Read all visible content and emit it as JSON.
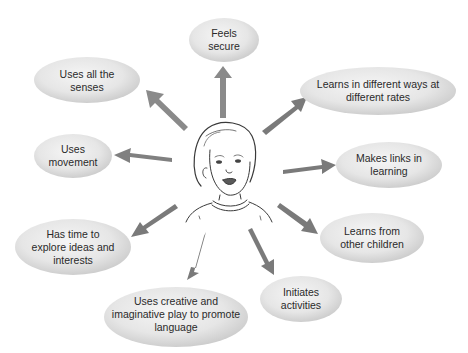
{
  "diagram": {
    "title": "",
    "center": {
      "label": "child-illustration"
    },
    "colors": {
      "bubble_light": "#f2f2f2",
      "bubble_dark": "#c9c9c9",
      "arrow_light": "#c4c4c4",
      "arrow_dark": "#6e6e6e",
      "text": "#2a2a2a",
      "sketch": "#3a3a3a"
    },
    "nodes": [
      {
        "id": "feels-secure",
        "lines": [
          "Feels",
          "secure"
        ]
      },
      {
        "id": "uses-all-senses",
        "lines": [
          "Uses all the",
          "senses"
        ]
      },
      {
        "id": "learns-different-ways",
        "lines": [
          "Learns in different ways at",
          "different rates"
        ]
      },
      {
        "id": "uses-movement",
        "lines": [
          "Uses",
          "movement"
        ]
      },
      {
        "id": "makes-links",
        "lines": [
          "Makes links in",
          "learning"
        ]
      },
      {
        "id": "has-time-to-explore",
        "lines": [
          "Has time to",
          "explore ideas and",
          "interests"
        ]
      },
      {
        "id": "learns-from-children",
        "lines": [
          "Learns from",
          "other children"
        ]
      },
      {
        "id": "initiates-activities",
        "lines": [
          "Initiates",
          "activities"
        ]
      },
      {
        "id": "creative-play",
        "lines": [
          "Uses creative and",
          "imaginative play to promote",
          "language"
        ]
      }
    ]
  }
}
